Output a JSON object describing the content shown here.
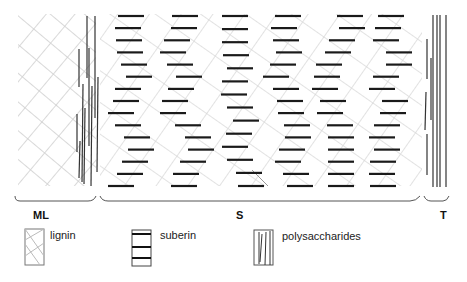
{
  "diagram": {
    "regions": [
      {
        "id": "ML",
        "label": "ML",
        "x0": 18,
        "x1": 96,
        "label_x": 33
      },
      {
        "id": "S",
        "label": "S",
        "x0": 100,
        "x1": 420,
        "label_x": 236
      },
      {
        "id": "T",
        "label": "T",
        "x0": 422,
        "x1": 450,
        "label_x": 440
      }
    ],
    "legend": [
      {
        "id": "lignin",
        "label": "lignin",
        "pattern": "crosshatch"
      },
      {
        "id": "suberin",
        "label": "suberin",
        "pattern": "horizontal-bars"
      },
      {
        "id": "polysaccharides",
        "label": "polysaccharides",
        "pattern": "vertical-lines"
      }
    ],
    "colors": {
      "lignin": "#c8c8c8",
      "suberin": "#1a1a1a",
      "polysaccharides": "#333333",
      "brace": "#555555"
    },
    "suberin_columns": [
      {
        "x": [
          118,
          115,
          116,
          117,
          121,
          126,
          115,
          113,
          108,
          115,
          124,
          128,
          122,
          117,
          108
        ]
      },
      {
        "x": [
          172,
          171,
          164,
          160,
          167,
          176,
          168,
          162,
          160,
          175,
          185,
          188,
          180,
          173,
          171
        ]
      },
      {
        "x": [
          222,
          222,
          222,
          223,
          227,
          222,
          221,
          227,
          233,
          226,
          222,
          227,
          236,
          238
        ]
      },
      {
        "x": [
          275,
          271,
          273,
          276,
          270,
          263,
          273,
          277,
          278,
          284,
          285,
          279,
          275,
          283,
          287
        ]
      },
      {
        "x": [
          337,
          339,
          329,
          325,
          316,
          314,
          312,
          320,
          317,
          327,
          328,
          328,
          328,
          328,
          328
        ]
      },
      {
        "x": [
          378,
          375,
          373,
          386,
          386,
          373,
          369,
          382,
          380,
          374,
          369,
          374,
          370,
          369,
          370
        ]
      }
    ]
  }
}
